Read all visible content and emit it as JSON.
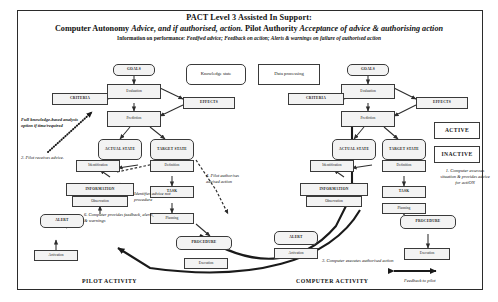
{
  "header": {
    "line1": "PACT Level 3 Assisted In Support:",
    "line2_a": "Computer Autonomy ",
    "line2_b": "Advice, and if authorised, action.",
    "line2_c": "  Pilot Authority ",
    "line2_d": "Acceptance of advice & authorising action",
    "line3_a": "Information on performance: ",
    "line3_b": "Feedfwd advice; Feedback on action; Alerts & warnings on failure of authorised action"
  },
  "pilot": {
    "goals": "GOALS",
    "evaluation": "Evaluation",
    "prediction": "Prediction",
    "criteria": "CRITERIA",
    "effects": "EFFECTS",
    "actual_state": "ACTUAL STATE",
    "target_state": "TARGET STATE",
    "identification": "Identification",
    "definition": "Definition",
    "information": "INFORMATION",
    "task": "TASK",
    "observation": "Observation",
    "planning": "Planning",
    "alert": "ALERT",
    "procedure": "PROCEDURE",
    "activation": "Activation",
    "execution": "Execution",
    "activity_label": "PILOT ACTIVITY"
  },
  "computer": {
    "goals": "GOALS",
    "evaluation": "Evaluation",
    "prediction": "Prediction",
    "criteria": "CRITERIA",
    "effects": "EFFECTS",
    "actual_state": "ACTUAL STATE",
    "target_state": "TARGET STATE",
    "identification": "Identification",
    "definition": "Definition",
    "information": "INFORMATION",
    "task": "TASK",
    "observation": "Observation",
    "planning": "Planning",
    "alert": "ALERT",
    "procedure": "PROCEDURE",
    "activation": "Activation",
    "execution": "Execution",
    "activity_label": "COMPUTER ACTIVITY"
  },
  "shared": {
    "knowledge_state": "Knowledge state",
    "data_processing": "Data processing",
    "active": "ACTIVE",
    "inactive": "INACTIVE"
  },
  "notes": {
    "full_knowledge": "Full knowledge-based analysis option if time/required",
    "step2": "2. Pilot receives advice.",
    "identifies": "Identifies advice not procedure",
    "step6": "6. Computer provides feedback, alerts, & warnings",
    "step4": "4. Pilot authorises advised action",
    "step3": "3. Computer executes authorised action",
    "step1": "1. Computer assesses situation & provides advice for actiON",
    "feedback": "Feedback to pilot"
  },
  "colors": {
    "line": "#2d2d2d",
    "node_fill": "#f3f3f3",
    "node_border": "#3a3a3a",
    "frame": "#2b2b2b"
  }
}
